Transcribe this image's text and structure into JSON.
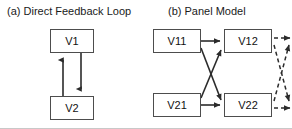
{
  "figure": {
    "width": 292,
    "height": 129,
    "background_color": "#ffffff",
    "line_color": "#2b2b2b",
    "node_border_color": "#4d4d4d",
    "text_color": "#111111"
  },
  "panels": {
    "a": {
      "title": "(a) Direct Feedback Loop",
      "nodes": [
        {
          "id": "v1",
          "label": "V1"
        },
        {
          "id": "v2",
          "label": "V2"
        }
      ],
      "edges": [
        {
          "from": "v2",
          "to": "v1",
          "style": "solid",
          "direction": "up"
        },
        {
          "from": "v1",
          "to": "v2",
          "style": "solid",
          "direction": "down"
        }
      ]
    },
    "b": {
      "title": "(b) Panel Model",
      "nodes": [
        {
          "id": "v11",
          "label": "V11"
        },
        {
          "id": "v12",
          "label": "V12"
        },
        {
          "id": "v21",
          "label": "V21"
        },
        {
          "id": "v22",
          "label": "V22"
        }
      ],
      "edges": [
        {
          "from": "v11",
          "to": "v12",
          "style": "solid",
          "kind": "autoregressive"
        },
        {
          "from": "v21",
          "to": "v22",
          "style": "solid",
          "kind": "autoregressive"
        },
        {
          "from": "v11",
          "to": "v22",
          "style": "solid",
          "kind": "cross-lagged"
        },
        {
          "from": "v21",
          "to": "v12",
          "style": "solid",
          "kind": "cross-lagged"
        },
        {
          "from": "v12",
          "to": "next-top",
          "style": "dashed",
          "kind": "autoregressive"
        },
        {
          "from": "v22",
          "to": "next-bottom",
          "style": "dashed",
          "kind": "autoregressive"
        },
        {
          "from": "v12",
          "to": "next-bottom",
          "style": "dashed",
          "kind": "cross-lagged"
        },
        {
          "from": "v22",
          "to": "next-top",
          "style": "dashed",
          "kind": "cross-lagged"
        }
      ]
    }
  }
}
